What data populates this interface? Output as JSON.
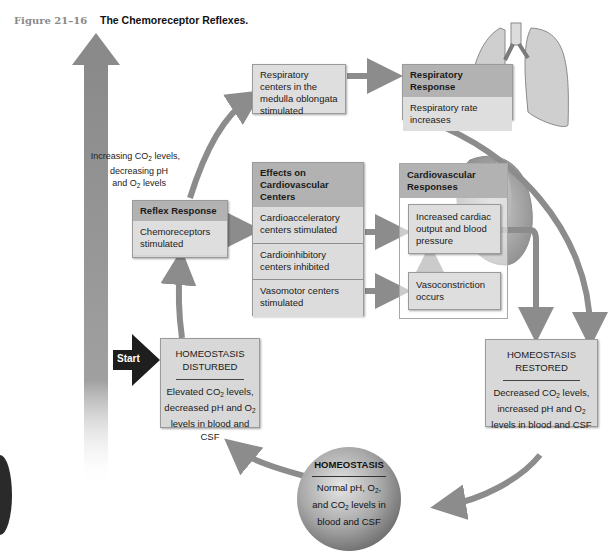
{
  "caption": {
    "figure_number": "Figure 21–16",
    "title": "The Chemoreceptor Reflexes."
  },
  "side_arrow_label": {
    "line1_pre": "Increasing CO",
    "line1_sub": "2",
    "line1_post": " levels,",
    "line2": "decreasing pH",
    "line3_pre": "and O",
    "line3_sub": "2",
    "line3_post": " levels"
  },
  "respiratory_centers": {
    "text": "Respiratory centers in the medulla oblongata stimulated"
  },
  "respiratory_response": {
    "header": "Respiratory Response",
    "body": "Respiratory rate increases"
  },
  "reflex_response": {
    "header": "Reflex Response",
    "body": "Chemoreceptors stimulated"
  },
  "cardiovascular_centers": {
    "header": "Effects on Cardiovascular Centers",
    "rows": [
      "Cardioacceleratory centers stimulated",
      "Cardioinhibitory centers inhibited",
      "Vasomotor centers stimulated"
    ]
  },
  "cardiovascular_responses": {
    "header": "Cardiovascular Responses",
    "cardiac": "Increased cardiac output and blood pressure",
    "vaso": "Vasoconstriction occurs"
  },
  "start": {
    "label": "Start"
  },
  "homeostasis_disturbed": {
    "title_line1": "HOMEOSTASIS",
    "title_line2": "DISTURBED",
    "line1_pre": "Elevated CO",
    "line1_sub": "2",
    "line1_post": " levels,",
    "line2_pre": "decreased pH and O",
    "line2_sub": "2",
    "line3": "levels in blood and CSF"
  },
  "homeostasis_restored": {
    "title_line1": "HOMEOSTASIS",
    "title_line2": "RESTORED",
    "line1_pre": "Decreased CO",
    "line1_sub": "2",
    "line1_post": " levels,",
    "line2_pre": "increased pH and O",
    "line2_sub": "2",
    "line3": "levels in blood and CSF"
  },
  "homeostasis": {
    "title": "HOMEOSTASIS",
    "line1_pre": "Normal pH, O",
    "line1_sub": "2",
    "line1_post": ",",
    "line2_pre": "and CO",
    "line2_sub": "2",
    "line2_post": " levels in",
    "line3": "blood and CSF"
  },
  "colors": {
    "arrow_gray": "#8c8c8c",
    "box_fill": "#dedede",
    "box_header": "#b2b2b2",
    "start_arrow": "#1e1e1e"
  }
}
